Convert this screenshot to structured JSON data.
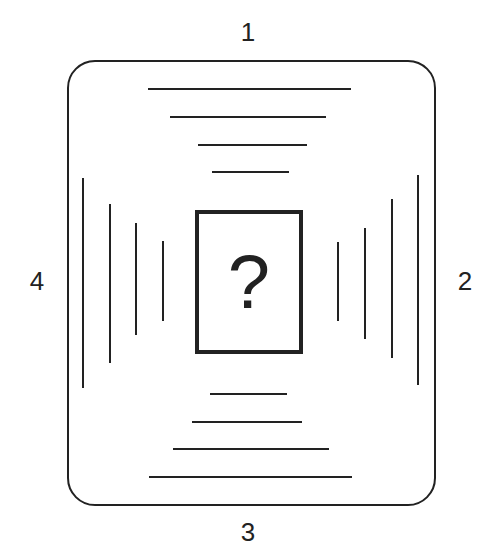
{
  "diagram": {
    "side_labels": {
      "top": "1",
      "right": "2",
      "bottom": "3",
      "left": "4"
    },
    "center": {
      "symbol": "?",
      "icon": "question-mark-icon"
    },
    "top_lines": [
      {
        "x1": 148,
        "x2": 351,
        "y": 89
      },
      {
        "x1": 170,
        "x2": 326,
        "y": 117
      },
      {
        "x1": 198,
        "x2": 307,
        "y": 145
      },
      {
        "x1": 212,
        "x2": 289,
        "y": 172
      }
    ],
    "bottom_lines": [
      {
        "x1": 210,
        "x2": 287,
        "y": 394
      },
      {
        "x1": 192,
        "x2": 302,
        "y": 422
      },
      {
        "x1": 173,
        "x2": 329,
        "y": 449
      },
      {
        "x1": 149,
        "x2": 352,
        "y": 477
      }
    ],
    "left_lines": [
      {
        "x": 83,
        "y1": 178,
        "y2": 388
      },
      {
        "x": 110,
        "y1": 204,
        "y2": 363
      },
      {
        "x": 136,
        "y1": 223,
        "y2": 335
      },
      {
        "x": 163,
        "y1": 241,
        "y2": 321
      }
    ],
    "right_lines": [
      {
        "x": 338,
        "y1": 242,
        "y2": 321
      },
      {
        "x": 365,
        "y1": 228,
        "y2": 339
      },
      {
        "x": 392,
        "y1": 199,
        "y2": 358
      },
      {
        "x": 418,
        "y1": 175,
        "y2": 385
      }
    ]
  }
}
